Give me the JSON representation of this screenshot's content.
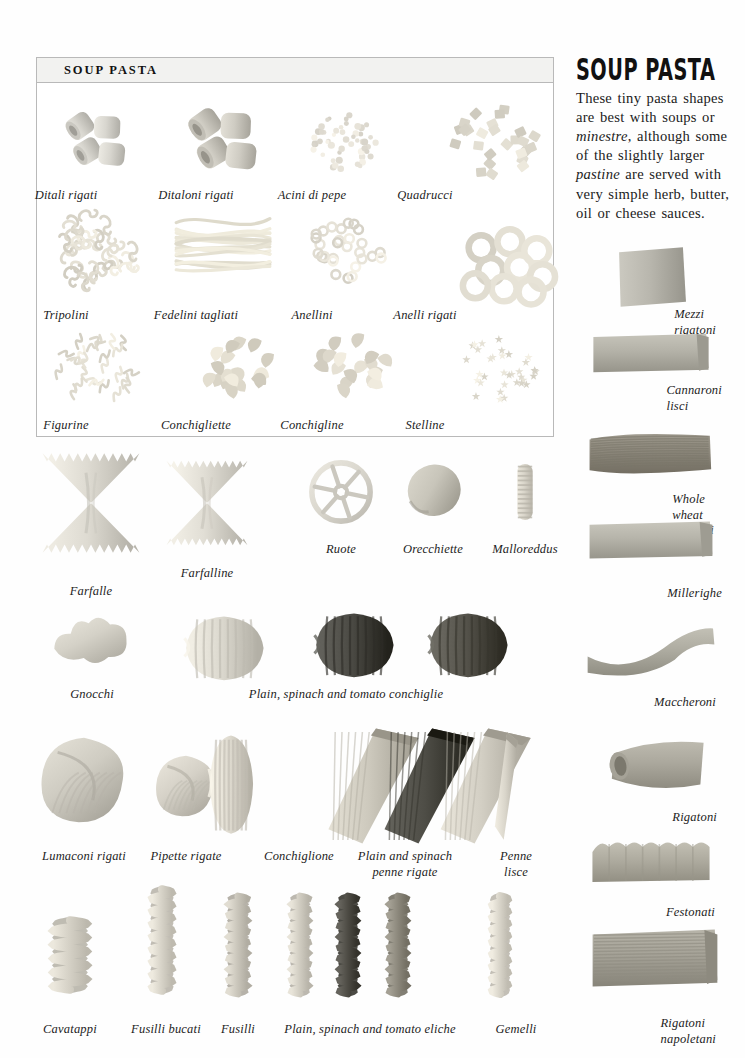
{
  "page": {
    "background": "#fefefe",
    "ink": "#1c1c1c"
  },
  "soup_box": {
    "title": "SOUP PASTA",
    "border_color": "#b9b9b9",
    "header_fill": "#f2f2f0",
    "items": [
      {
        "label": "Ditali rigati",
        "shape": "short-tubes",
        "cx": 95,
        "cy": 140,
        "tone": "#d8d6cf"
      },
      {
        "label": "Ditaloni rigati",
        "shape": "short-tubes-lg",
        "cx": 222,
        "cy": 140,
        "tone": "#cfccc3"
      },
      {
        "label": "Acini di pepe",
        "shape": "grain-cluster",
        "cx": 345,
        "cy": 143,
        "tone": "#ddd9cf"
      },
      {
        "label": "Quadrucci",
        "shape": "square-flakes",
        "cx": 498,
        "cy": 143,
        "tone": "#d6d2c6"
      },
      {
        "label": "Tripolini",
        "shape": "knot-cluster",
        "cx": 95,
        "cy": 250,
        "tone": "#d9d5c9"
      },
      {
        "label": "Fedelini tagliati",
        "shape": "cut-strands",
        "cx": 222,
        "cy": 245,
        "tone": "#e2decf"
      },
      {
        "label": "Anellini",
        "shape": "tiny-rings",
        "cx": 345,
        "cy": 252,
        "tone": "#dcd8cd"
      },
      {
        "label": "Anelli rigati",
        "shape": "big-rings",
        "cx": 508,
        "cy": 263,
        "tone": "#dad6ca"
      },
      {
        "label": "Figurine",
        "shape": "letters",
        "cx": 98,
        "cy": 368,
        "tone": "#dbd7cb"
      },
      {
        "label": "Conchigliette",
        "shape": "mini-shells",
        "cx": 230,
        "cy": 365,
        "tone": "#d7d2c4"
      },
      {
        "label": "Conchigline",
        "shape": "mini-shells-2",
        "cx": 355,
        "cy": 368,
        "tone": "#d9d4c7"
      },
      {
        "label": "Stelline",
        "shape": "stars",
        "cx": 497,
        "cy": 370,
        "tone": "#dcd8cc"
      }
    ],
    "caption_rows_y": [
      188,
      308,
      418
    ]
  },
  "rail": {
    "title": "SOUP PASTA",
    "paragraph_parts": [
      {
        "text": "These tiny pasta shapes are best with soups or ",
        "italic": false
      },
      {
        "text": "minestre",
        "italic": true
      },
      {
        "text": ", although some of the slightly larger ",
        "italic": false
      },
      {
        "text": "pastine",
        "italic": true
      },
      {
        "text": " are served with very simple herb, butter, oil or cheese sauces.",
        "italic": false
      }
    ],
    "paragraph_plain": "These tiny pasta shapes are best with soups or minestre, although some of the slightly larger pastine are served with very simple herb, butter, oil or cheese sauces.",
    "items": [
      {
        "label": "Mezzi rigatoni",
        "shape": "tube-square",
        "cx": 651,
        "cy": 277,
        "cap_x": 716,
        "cap_y": 307,
        "tone": "#b9b7ae",
        "align": "right"
      },
      {
        "label": "Cannaroni lisci",
        "shape": "tube-wide",
        "cx": 651,
        "cy": 353,
        "cap_x": 722,
        "cap_y": 383,
        "tone": "#b4b2a8",
        "align": "right"
      },
      {
        "label": "Whole wheat rigatoni",
        "shape": "tube-ridged",
        "cx": 651,
        "cy": 454,
        "cap_x": 714,
        "cap_y": 492,
        "tone": "#8d887c",
        "align": "right"
      },
      {
        "label": "Millerighe",
        "shape": "tube-slim",
        "cx": 651,
        "cy": 540,
        "cap_x": 722,
        "cap_y": 586,
        "tone": "#b6b4aa",
        "align": "right"
      },
      {
        "label": "Maccheroni",
        "shape": "tube-bent",
        "cx": 651,
        "cy": 650,
        "cap_x": 716,
        "cap_y": 695,
        "tone": "#aeaca1",
        "align": "right"
      },
      {
        "label": "Rigatoni",
        "shape": "tube-cut",
        "cx": 655,
        "cy": 766,
        "cap_x": 717,
        "cap_y": 810,
        "tone": "#aba89d",
        "align": "right"
      },
      {
        "label": "Festonati",
        "shape": "tube-scallop",
        "cx": 651,
        "cy": 862,
        "cap_x": 715,
        "cap_y": 905,
        "tone": "#aeab9f",
        "align": "right"
      },
      {
        "label": "Rigatoni napoletani",
        "shape": "tube-striped",
        "cx": 655,
        "cy": 958,
        "cap_x": 716,
        "cap_y": 1016,
        "tone": "#a5a297"
      }
    ]
  },
  "rows": [
    {
      "name": "farfalle-row",
      "items": [
        {
          "label": "Farfalle",
          "shape": "bowtie",
          "cx": 91,
          "cy": 503,
          "cap_x": 91,
          "cap_y": 584,
          "tone": "#dedbd2",
          "w": 110,
          "h": 108
        },
        {
          "label": "Farfalline",
          "shape": "bowtie",
          "cx": 207,
          "cy": 503,
          "cap_x": 207,
          "cap_y": 566,
          "tone": "#e1ded5",
          "w": 92,
          "h": 92
        },
        {
          "label": "Ruote",
          "shape": "wheel",
          "cx": 341,
          "cy": 492,
          "cap_x": 341,
          "cap_y": 542,
          "tone": "#dbd8cf",
          "w": 62,
          "h": 62
        },
        {
          "label": "Orecchiette",
          "shape": "orecchietta",
          "cx": 433,
          "cy": 492,
          "cap_x": 433,
          "cap_y": 542,
          "tone": "#c8c5ba",
          "w": 62,
          "h": 58
        },
        {
          "label": "Malloreddus",
          "shape": "malloreddu",
          "cx": 525,
          "cy": 492,
          "cap_x": 525,
          "cap_y": 542,
          "tone": "#d9d5ca",
          "w": 24,
          "h": 62
        }
      ]
    },
    {
      "name": "conchiglie-row",
      "items": [
        {
          "label": "Gnocchi",
          "shape": "gnocco",
          "cx": 92,
          "cy": 643,
          "cap_x": 92,
          "cap_y": 687,
          "tone": "#d4d1c7",
          "w": 82,
          "h": 58
        },
        {
          "label": "",
          "shape": "conchiglia",
          "cx": 224,
          "cy": 648,
          "cap_x": 0,
          "cap_y": 0,
          "tone": "#dbd8ce",
          "w": 86,
          "h": 70
        },
        {
          "label": "",
          "shape": "conchiglia",
          "cx": 354,
          "cy": 645,
          "cap_x": 0,
          "cap_y": 0,
          "tone": "#4b4a44",
          "w": 86,
          "h": 70
        },
        {
          "label": "",
          "shape": "conchiglia",
          "cx": 468,
          "cy": 645,
          "cap_x": 0,
          "cap_y": 0,
          "tone": "#55534b",
          "w": 86,
          "h": 70
        }
      ],
      "group_label": {
        "text": "Plain, spinach and tomato conchiglie",
        "cap_x": 346,
        "cap_y": 687
      }
    },
    {
      "name": "penne-row",
      "items": [
        {
          "label": "Lumaconi rigati",
          "shape": "lumacone",
          "cx": 84,
          "cy": 780,
          "cap_x": 84,
          "cap_y": 849,
          "tone": "#cfccc2",
          "w": 88,
          "h": 92
        },
        {
          "label": "Pipette rigate",
          "shape": "pipetta",
          "cx": 186,
          "cy": 786,
          "cap_x": 186,
          "cap_y": 849,
          "tone": "#d5d1c7",
          "w": 62,
          "h": 66
        },
        {
          "label": "Conchiglione",
          "shape": "conchiglione",
          "cx": 231,
          "cy": 784,
          "cap_x": 299,
          "cap_y": 849,
          "tone": "#dedacf",
          "w": 48,
          "h": 108
        },
        {
          "label": "Plain and spinach\npenne rigate",
          "shape": "penne-trio",
          "cx": 410,
          "cy": 786,
          "cap_x": 405,
          "cap_y": 849,
          "tone": "#cdc9bd",
          "w": 170,
          "h": 120
        },
        {
          "label": "Penne\nlisce",
          "shape": "penna",
          "cx": 516,
          "cy": 786,
          "cap_x": 516,
          "cap_y": 849,
          "tone": "#d9d5ca",
          "w": 44,
          "h": 112
        }
      ]
    },
    {
      "name": "fusilli-row",
      "items": [
        {
          "label": "Cavatappi",
          "shape": "cavatappo",
          "cx": 70,
          "cy": 955,
          "cap_x": 70,
          "cap_y": 1022,
          "tone": "#d6d2c7",
          "w": 46,
          "h": 74
        },
        {
          "label": "Fusilli bucati",
          "shape": "spiral",
          "cx": 162,
          "cy": 940,
          "cap_x": 166,
          "cap_y": 1022,
          "tone": "#d8d4c9",
          "w": 30,
          "h": 108
        },
        {
          "label": "Fusilli",
          "shape": "spiral-tight",
          "cx": 238,
          "cy": 945,
          "cap_x": 238,
          "cap_y": 1022,
          "tone": "#cbc7bc",
          "w": 28,
          "h": 104
        },
        {
          "label": "",
          "shape": "spiral-tight",
          "cx": 300,
          "cy": 945,
          "cap_x": 0,
          "cap_y": 0,
          "tone": "#d2cec3",
          "w": 26,
          "h": 104
        },
        {
          "label": "",
          "shape": "spiral-tight",
          "cx": 348,
          "cy": 945,
          "cap_x": 0,
          "cap_y": 0,
          "tone": "#4f4d46",
          "w": 26,
          "h": 104
        },
        {
          "label": "",
          "shape": "spiral-tight",
          "cx": 398,
          "cy": 945,
          "cap_x": 0,
          "cap_y": 0,
          "tone": "#8e8a7e",
          "w": 26,
          "h": 104
        },
        {
          "label": "Gemelli",
          "shape": "gemello",
          "cx": 500,
          "cy": 945,
          "cap_x": 516,
          "cap_y": 1022,
          "tone": "#dad6cb",
          "w": 24,
          "h": 104
        }
      ],
      "group_label": {
        "text": "Plain, spinach and tomato eliche",
        "cap_x": 370,
        "cap_y": 1022
      }
    }
  ]
}
